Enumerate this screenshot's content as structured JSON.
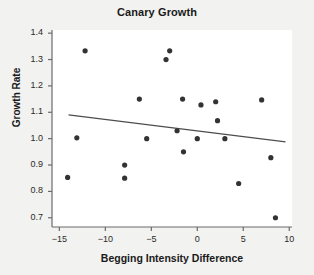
{
  "chart_data": {
    "type": "scatter",
    "title": "Canary Growth",
    "xlabel": "Begging Intensity Difference",
    "ylabel": "Growth Rate",
    "xlim": [
      -15.8,
      10.3
    ],
    "ylim": [
      0.665,
      1.412
    ],
    "xticks": [
      -15,
      -10,
      -5,
      0,
      5,
      10
    ],
    "xtick_labels": [
      "−15",
      "−10",
      "−5",
      "0",
      "5",
      "10"
    ],
    "yticks": [
      0.7,
      0.8,
      0.9,
      1.0,
      1.1,
      1.2,
      1.3,
      1.4
    ],
    "ytick_labels": [
      "0.7",
      "0.8",
      "0.9",
      "1.0",
      "1.1",
      "1.2",
      "1.3",
      "1.4"
    ],
    "grid": false,
    "legend": null,
    "marker_color": "#333333",
    "marker_size": 4.6,
    "line_color": "#4d4d4d",
    "points": [
      {
        "x": -14.1,
        "y": 0.853
      },
      {
        "x": -13.1,
        "y": 1.003
      },
      {
        "x": -12.2,
        "y": 1.333
      },
      {
        "x": -7.9,
        "y": 0.9
      },
      {
        "x": -7.9,
        "y": 0.85
      },
      {
        "x": -6.3,
        "y": 1.15
      },
      {
        "x": -5.5,
        "y": 1.0
      },
      {
        "x": -3.4,
        "y": 1.3
      },
      {
        "x": -3.0,
        "y": 1.333
      },
      {
        "x": -2.2,
        "y": 1.03
      },
      {
        "x": -1.6,
        "y": 1.15
      },
      {
        "x": -1.5,
        "y": 0.95
      },
      {
        "x": 0.0,
        "y": 1.0
      },
      {
        "x": 0.4,
        "y": 1.128
      },
      {
        "x": 2.0,
        "y": 1.14
      },
      {
        "x": 2.2,
        "y": 1.068
      },
      {
        "x": 3.0,
        "y": 1.0
      },
      {
        "x": 4.5,
        "y": 0.83
      },
      {
        "x": 7.0,
        "y": 1.147
      },
      {
        "x": 8.0,
        "y": 0.928
      },
      {
        "x": 8.5,
        "y": 0.7
      }
    ],
    "fit_line": {
      "x_start": -14.0,
      "y_start": 1.09,
      "x_end": 9.6,
      "y_end": 0.988
    }
  }
}
